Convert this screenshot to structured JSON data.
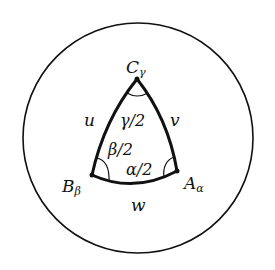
{
  "diagram": {
    "vertices": [
      {
        "id": "C",
        "label": "C",
        "subscript": "γ"
      },
      {
        "id": "B",
        "label": "B",
        "subscript": "β"
      },
      {
        "id": "A",
        "label": "A",
        "subscript": "α"
      }
    ],
    "edges": [
      {
        "id": "u",
        "label": "u"
      },
      {
        "id": "v",
        "label": "v"
      },
      {
        "id": "w",
        "label": "w"
      }
    ],
    "angles": [
      {
        "id": "gamma",
        "label": "γ/2"
      },
      {
        "id": "beta",
        "label": "β/2"
      },
      {
        "id": "alpha",
        "label": "α/2"
      }
    ],
    "stroke_color": "#111111",
    "background": "#ffffff"
  }
}
